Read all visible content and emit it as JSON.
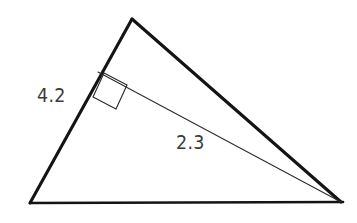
{
  "figure": {
    "kind": "triangle-with-altitude",
    "background_color": "#ffffff",
    "stroke_color": "#141414",
    "thin_stroke_color": "#2b2b2b",
    "label_color": "#3b3b3b",
    "vertices": {
      "apex": [
        132,
        19
      ],
      "bottom_left": [
        30,
        203
      ],
      "bottom_right": [
        341,
        202
      ]
    },
    "cevian": {
      "from": [
        98,
        72
      ],
      "to": [
        341,
        202
      ],
      "description": "thin segment from left side to bottom-right vertex"
    },
    "right_angle_marker": {
      "points": [
        [
          104,
          73
        ],
        [
          127,
          85
        ],
        [
          116,
          109
        ],
        [
          93,
          97
        ]
      ],
      "at_vertex": [
        98,
        72
      ]
    },
    "labels": {
      "side_a": "4.2",
      "side_b": "2.3"
    }
  }
}
